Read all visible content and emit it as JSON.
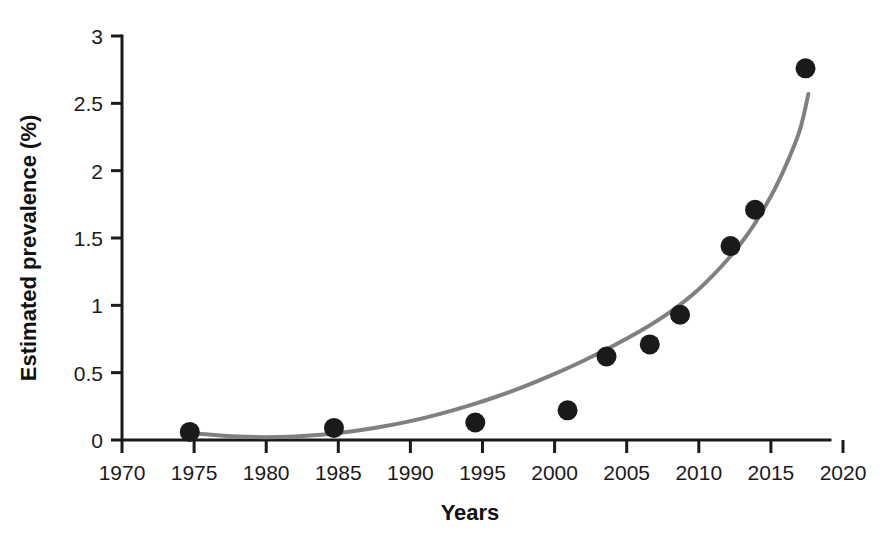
{
  "chart_data": {
    "type": "scatter",
    "title": "",
    "xlabel": "Years",
    "ylabel": "Estimated prevalence (%)",
    "xlim": [
      1970,
      2020
    ],
    "ylim": [
      0,
      3
    ],
    "xticks": [
      1970,
      1975,
      1980,
      1985,
      1990,
      1995,
      2000,
      2005,
      2010,
      2015,
      2020
    ],
    "xtick_labels": [
      "1970",
      "1975",
      "1980",
      "1985",
      "1990",
      "1995",
      "2000",
      "2005",
      "2010",
      "2015",
      "2020"
    ],
    "yticks": [
      0,
      0.5,
      1,
      1.5,
      2,
      2.5,
      3
    ],
    "ytick_labels": [
      "0",
      "0.5",
      "1",
      "1.5",
      "2",
      "2.5",
      "3"
    ],
    "grid": false,
    "legend": false,
    "series": [
      {
        "name": "Estimated prevalence",
        "marker": "filled-circle",
        "color": "#1a1a1a",
        "points": [
          {
            "x": 1974.7,
            "y": 0.06
          },
          {
            "x": 1984.7,
            "y": 0.09
          },
          {
            "x": 1994.5,
            "y": 0.13
          },
          {
            "x": 2000.9,
            "y": 0.22
          },
          {
            "x": 2003.6,
            "y": 0.62
          },
          {
            "x": 2006.6,
            "y": 0.71
          },
          {
            "x": 2008.7,
            "y": 0.93
          },
          {
            "x": 2012.2,
            "y": 1.44
          },
          {
            "x": 2013.9,
            "y": 1.71
          },
          {
            "x": 2017.4,
            "y": 2.76
          }
        ]
      },
      {
        "name": "Fitted exponential trend",
        "marker": "none",
        "line": "solid",
        "color": "#808080",
        "points": [
          {
            "x": 1974.7,
            "y": 0.055
          },
          {
            "x": 1976.0,
            "y": 0.04
          },
          {
            "x": 1978.0,
            "y": 0.026
          },
          {
            "x": 1980.0,
            "y": 0.021
          },
          {
            "x": 1982.0,
            "y": 0.026
          },
          {
            "x": 1984.0,
            "y": 0.04
          },
          {
            "x": 1986.0,
            "y": 0.065
          },
          {
            "x": 1988.0,
            "y": 0.098
          },
          {
            "x": 1990.0,
            "y": 0.14
          },
          {
            "x": 1992.0,
            "y": 0.192
          },
          {
            "x": 1994.0,
            "y": 0.253
          },
          {
            "x": 1996.0,
            "y": 0.323
          },
          {
            "x": 1998.0,
            "y": 0.402
          },
          {
            "x": 2000.0,
            "y": 0.491
          },
          {
            "x": 2002.0,
            "y": 0.589
          },
          {
            "x": 2004.0,
            "y": 0.696
          },
          {
            "x": 2006.0,
            "y": 0.813
          },
          {
            "x": 2008.0,
            "y": 0.95
          },
          {
            "x": 2010.0,
            "y": 1.12
          },
          {
            "x": 2012.0,
            "y": 1.34
          },
          {
            "x": 2013.5,
            "y": 1.545
          },
          {
            "x": 2015.0,
            "y": 1.81
          },
          {
            "x": 2016.0,
            "y": 2.03
          },
          {
            "x": 2017.0,
            "y": 2.3
          },
          {
            "x": 2017.6,
            "y": 2.57
          }
        ]
      }
    ]
  },
  "axes": {
    "y_title": "Estimated prevalence (%)",
    "x_title": "Years"
  }
}
